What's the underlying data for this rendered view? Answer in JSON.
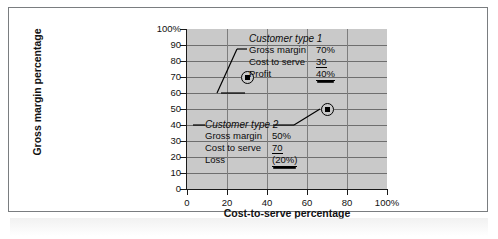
{
  "figure": {
    "y_axis_title": "Gross margin percentage",
    "x_axis_title": "Cost-to-serve percentage"
  },
  "callouts": [
    {
      "title": "Customer type 1",
      "rows": [
        {
          "label": "Gross margin",
          "value": "70%",
          "underline": "none"
        },
        {
          "label": "Cost to serve",
          "value": "30",
          "underline": "single"
        },
        {
          "label": "Profit",
          "value": "40%",
          "underline": "double"
        }
      ]
    },
    {
      "title": "Customer type 2",
      "rows": [
        {
          "label": "Gross margin",
          "value": "50%",
          "underline": "none"
        },
        {
          "label": "Cost to serve",
          "value": "70",
          "underline": "single"
        },
        {
          "label": "Loss",
          "value": "(20%)",
          "underline": "double"
        }
      ]
    }
  ],
  "chart_data": {
    "type": "scatter",
    "title": "",
    "xlabel": "Cost-to-serve percentage",
    "ylabel": "Gross margin percentage",
    "xlim": [
      0,
      100
    ],
    "ylim": [
      0,
      100
    ],
    "xticks": [
      0,
      20,
      40,
      60,
      80,
      100
    ],
    "xticklabels": [
      "0",
      "20",
      "40",
      "60",
      "80",
      "100%"
    ],
    "yticks": [
      0,
      10,
      20,
      30,
      40,
      50,
      60,
      70,
      80,
      90,
      100
    ],
    "yticklabels": [
      "0",
      "10",
      "20",
      "30",
      "40",
      "50",
      "60",
      "70",
      "80",
      "90",
      "100%"
    ],
    "grid": true,
    "legend": "none",
    "plot_background": "#c9c9c9",
    "gridline_color": "#6e6e6e",
    "marker_color": "#000000",
    "points": [
      {
        "name": "Customer type 1",
        "x": 30,
        "y": 70
      },
      {
        "name": "Customer type 2",
        "x": 70,
        "y": 50
      }
    ],
    "annotations": [
      "Customer type 1: Gross margin 70%, Cost to serve 30, Profit 40%",
      "Customer type 2: Gross margin 50%, Cost to serve 70, Loss (20%)"
    ]
  }
}
